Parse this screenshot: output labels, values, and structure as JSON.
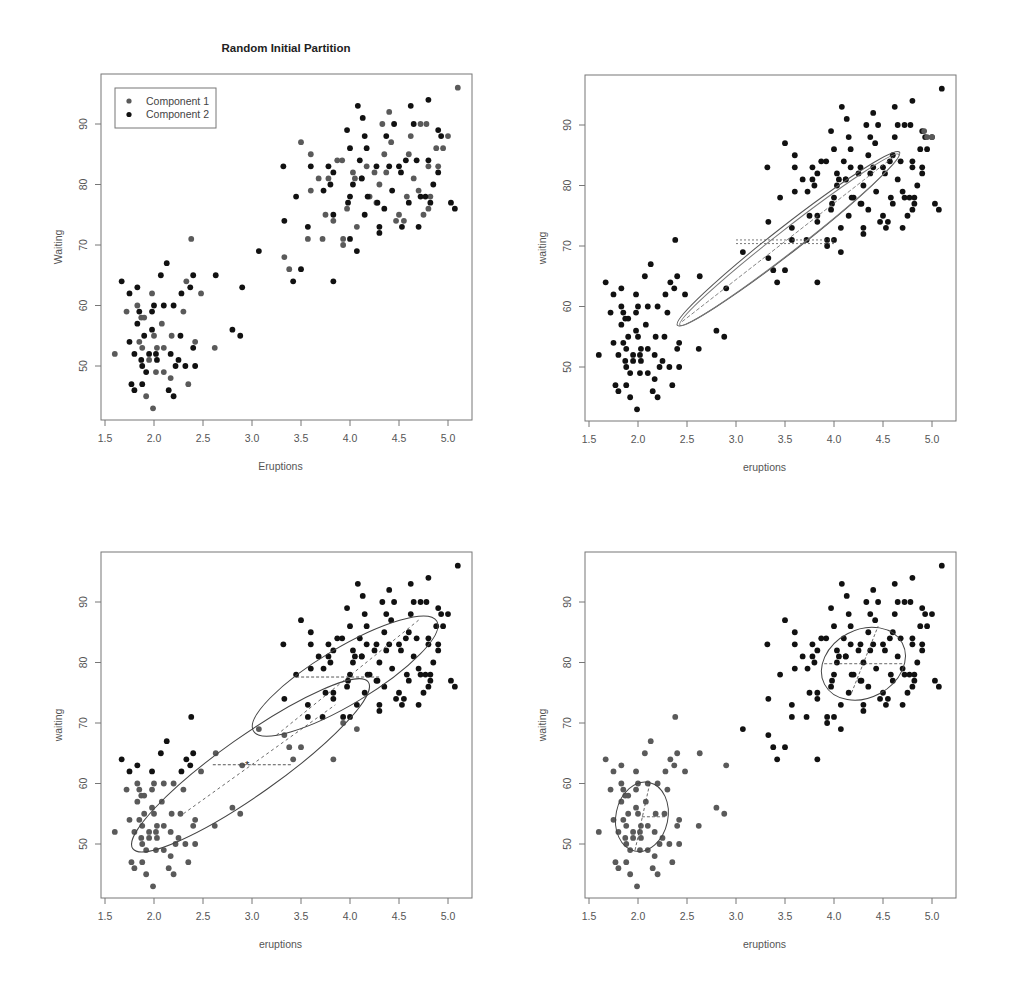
{
  "figure": {
    "title": "Random Initial Partition",
    "colors": {
      "component1": "#5a5a5a",
      "component2": "#111111",
      "axis": "#777777",
      "text": "#555555",
      "ellipse": "#444444"
    }
  },
  "chart_data": [
    {
      "type": "scatter",
      "panel": "top-left",
      "title": "Random Initial Partition",
      "xlabel": "Eruptions",
      "ylabel": "Waiting",
      "xticks": [
        "1.5",
        "2.0",
        "2.5",
        "3.0",
        "3.5",
        "4.0",
        "4.5",
        "5.0"
      ],
      "yticks": [
        "50",
        "60",
        "70",
        "80",
        "90"
      ],
      "xlim": [
        1.55,
        5.2
      ],
      "ylim": [
        41.5,
        97
      ],
      "legend": {
        "position": "top-left",
        "entries": [
          "Component 1",
          "Component 2"
        ]
      },
      "series": [
        {
          "name": "Component 1",
          "color": "#5a5a5a",
          "points": [
            [
              1.6,
              52
            ],
            [
              1.72,
              59
            ],
            [
              1.83,
              60
            ],
            [
              1.85,
              54
            ],
            [
              1.87,
              58
            ],
            [
              1.88,
              53
            ],
            [
              1.9,
              58
            ],
            [
              1.92,
              45
            ],
            [
              1.95,
              51
            ],
            [
              1.98,
              62
            ],
            [
              1.99,
              43
            ],
            [
              2.0,
              55
            ],
            [
              2.02,
              49
            ],
            [
              2.03,
              53
            ],
            [
              2.08,
              57
            ],
            [
              2.1,
              53
            ],
            [
              2.1,
              49
            ],
            [
              2.17,
              48
            ],
            [
              2.18,
              55
            ],
            [
              2.3,
              59
            ],
            [
              2.33,
              64
            ],
            [
              2.35,
              47
            ],
            [
              2.38,
              71
            ],
            [
              2.42,
              54
            ],
            [
              2.48,
              62
            ],
            [
              2.62,
              53
            ],
            [
              3.33,
              68
            ],
            [
              3.38,
              66
            ],
            [
              3.5,
              87
            ],
            [
              3.6,
              85
            ],
            [
              3.6,
              79
            ],
            [
              3.57,
              71
            ],
            [
              3.68,
              81
            ],
            [
              3.72,
              71
            ],
            [
              3.75,
              75
            ],
            [
              3.78,
              81
            ],
            [
              3.83,
              74
            ],
            [
              3.87,
              84
            ],
            [
              3.92,
              84
            ],
            [
              3.93,
              70
            ],
            [
              3.93,
              71
            ],
            [
              3.97,
              76
            ],
            [
              4.03,
              82
            ],
            [
              4.05,
              81
            ],
            [
              4.07,
              73
            ],
            [
              4.12,
              81
            ],
            [
              4.17,
              83
            ],
            [
              4.2,
              78
            ],
            [
              4.25,
              82
            ],
            [
              4.27,
              77
            ],
            [
              4.3,
              80
            ],
            [
              4.33,
              90
            ],
            [
              4.35,
              85
            ],
            [
              4.37,
              82
            ],
            [
              4.4,
              92
            ],
            [
              4.42,
              87
            ],
            [
              4.47,
              74
            ],
            [
              4.5,
              75
            ],
            [
              4.55,
              74
            ],
            [
              4.58,
              78
            ],
            [
              4.6,
              85
            ],
            [
              4.62,
              88
            ],
            [
              4.65,
              81
            ],
            [
              4.7,
              79
            ],
            [
              4.72,
              90
            ],
            [
              4.75,
              75
            ],
            [
              4.78,
              90
            ],
            [
              4.8,
              83
            ],
            [
              4.8,
              76
            ],
            [
              4.82,
              78
            ],
            [
              4.88,
              86
            ],
            [
              4.9,
              83
            ],
            [
              4.95,
              86
            ],
            [
              5.0,
              88
            ],
            [
              5.1,
              96
            ]
          ]
        },
        {
          "name": "Component 2",
          "color": "#111111",
          "points": [
            [
              1.67,
              64
            ],
            [
              1.75,
              62
            ],
            [
              1.75,
              54
            ],
            [
              1.77,
              47
            ],
            [
              1.8,
              52
            ],
            [
              1.8,
              46
            ],
            [
              1.83,
              63
            ],
            [
              1.83,
              57
            ],
            [
              1.85,
              59
            ],
            [
              1.87,
              51
            ],
            [
              1.88,
              50
            ],
            [
              1.88,
              47
            ],
            [
              1.9,
              55
            ],
            [
              1.92,
              49
            ],
            [
              1.95,
              52
            ],
            [
              1.98,
              56
            ],
            [
              1.98,
              59
            ],
            [
              2.0,
              60
            ],
            [
              2.02,
              52
            ],
            [
              2.03,
              51
            ],
            [
              2.07,
              65
            ],
            [
              2.1,
              60
            ],
            [
              2.13,
              67
            ],
            [
              2.15,
              46
            ],
            [
              2.17,
              52
            ],
            [
              2.2,
              60
            ],
            [
              2.2,
              45
            ],
            [
              2.22,
              50
            ],
            [
              2.25,
              51
            ],
            [
              2.27,
              55
            ],
            [
              2.28,
              62
            ],
            [
              2.32,
              50
            ],
            [
              2.37,
              63
            ],
            [
              2.4,
              65
            ],
            [
              2.42,
              50
            ],
            [
              2.4,
              53
            ],
            [
              2.63,
              65
            ],
            [
              2.8,
              56
            ],
            [
              2.88,
              55
            ],
            [
              2.9,
              63
            ],
            [
              3.07,
              69
            ],
            [
              3.32,
              83
            ],
            [
              3.33,
              74
            ],
            [
              3.42,
              64
            ],
            [
              3.45,
              78
            ],
            [
              3.5,
              66
            ],
            [
              3.57,
              73
            ],
            [
              3.6,
              83
            ],
            [
              3.73,
              79
            ],
            [
              3.78,
              83
            ],
            [
              3.8,
              80
            ],
            [
              3.83,
              82
            ],
            [
              3.83,
              75
            ],
            [
              3.83,
              64
            ],
            [
              3.97,
              89
            ],
            [
              3.98,
              77
            ],
            [
              4.0,
              86
            ],
            [
              4.0,
              78
            ],
            [
              4.0,
              71
            ],
            [
              4.03,
              80
            ],
            [
              4.07,
              69
            ],
            [
              4.08,
              93
            ],
            [
              4.1,
              84
            ],
            [
              4.12,
              81
            ],
            [
              4.13,
              91
            ],
            [
              4.15,
              88
            ],
            [
              4.15,
              75
            ],
            [
              4.17,
              86
            ],
            [
              4.18,
              78
            ],
            [
              4.27,
              83
            ],
            [
              4.28,
              77
            ],
            [
              4.3,
              73
            ],
            [
              4.3,
              72
            ],
            [
              4.35,
              76
            ],
            [
              4.37,
              88
            ],
            [
              4.4,
              83
            ],
            [
              4.43,
              79
            ],
            [
              4.45,
              90
            ],
            [
              4.5,
              83
            ],
            [
              4.52,
              82
            ],
            [
              4.53,
              73
            ],
            [
              4.57,
              84
            ],
            [
              4.6,
              77
            ],
            [
              4.62,
              93
            ],
            [
              4.65,
              90
            ],
            [
              4.68,
              84
            ],
            [
              4.7,
              73
            ],
            [
              4.72,
              78
            ],
            [
              4.77,
              78
            ],
            [
              4.8,
              94
            ],
            [
              4.8,
              84
            ],
            [
              4.82,
              77
            ],
            [
              4.85,
              80
            ],
            [
              4.9,
              89
            ],
            [
              4.9,
              82
            ],
            [
              4.93,
              88
            ],
            [
              5.03,
              77
            ],
            [
              5.07,
              76
            ]
          ]
        }
      ]
    },
    {
      "type": "scatter",
      "panel": "top-right",
      "xlabel": "eruptions",
      "ylabel": "waiting",
      "xticks": [
        "1.5",
        "2.0",
        "2.5",
        "3.0",
        "3.5",
        "4.0",
        "4.5",
        "5.0"
      ],
      "yticks": [
        "50",
        "60",
        "70",
        "80",
        "90"
      ],
      "xlim": [
        1.55,
        5.2
      ],
      "ylim": [
        41.5,
        97
      ],
      "ellipses": [
        {
          "cx": 3.55,
          "cy": 71,
          "major_end1": [
            2.45,
            57.5
          ],
          "major_end2": [
            4.6,
            84.8
          ],
          "halfwidth_px": 9,
          "style": "solid double"
        }
      ],
      "series": [
        {
          "name": "Component 1",
          "color": "#5a5a5a",
          "points": [
            [
              4.92,
              89
            ],
            [
              4.95,
              88
            ],
            [
              5.0,
              88
            ]
          ]
        },
        {
          "name": "Component 2",
          "color": "#111111",
          "points": "all remaining observations"
        }
      ]
    },
    {
      "type": "scatter",
      "panel": "bottom-left",
      "xlabel": "eruptions",
      "ylabel": "waiting",
      "xticks": [
        "1.5",
        "2.0",
        "2.5",
        "3.0",
        "3.5",
        "4.0",
        "4.5",
        "5.0"
      ],
      "yticks": [
        "50",
        "60",
        "70",
        "80",
        "90"
      ],
      "xlim": [
        1.55,
        5.2
      ],
      "ylim": [
        41.5,
        97
      ],
      "ellipses": [
        {
          "center": [
            2.95,
            63
          ],
          "major_end1": [
            1.85,
            50
          ],
          "major_end2": [
            4.1,
            76
          ],
          "minor_halfwidth_x": 0.55
        },
        {
          "center": [
            4.0,
            77.5
          ],
          "major_end1": [
            3.05,
            69
          ],
          "major_end2": [
            4.85,
            87
          ],
          "minor_halfwidth_x": 0.6
        }
      ]
    },
    {
      "type": "scatter",
      "panel": "bottom-right",
      "xlabel": "eruptions",
      "ylabel": "waiting",
      "xticks": [
        "1.5",
        "2.0",
        "2.5",
        "3.0",
        "3.5",
        "4.0",
        "4.5",
        "5.0"
      ],
      "yticks": [
        "50",
        "60",
        "70",
        "80",
        "90"
      ],
      "xlim": [
        1.55,
        5.2
      ],
      "ylim": [
        41.5,
        97
      ],
      "ellipses": [
        {
          "center": [
            2.04,
            54.5
          ],
          "rx_units": 0.3,
          "ry_units": 5.8,
          "tilt": "slight"
        },
        {
          "center": [
            4.3,
            80
          ],
          "rx_units": 0.45,
          "ry_units": 6.3,
          "tilt": "positive"
        }
      ],
      "clusters": {
        "component1": "points with eruptions < 3.0 (gray)",
        "component2": "points with eruptions >= 3.0 (black)"
      }
    }
  ],
  "panels": [
    {
      "id": "tl",
      "xlabel": "Eruptions",
      "ylabel": "Waiting"
    },
    {
      "id": "tr",
      "xlabel": "eruptions",
      "ylabel": "waiting"
    },
    {
      "id": "bl",
      "xlabel": "eruptions",
      "ylabel": "waiting"
    },
    {
      "id": "br",
      "xlabel": "eruptions",
      "ylabel": "waiting"
    }
  ],
  "legend": {
    "entries": [
      {
        "label": "Component 1",
        "color": "#5a5a5a"
      },
      {
        "label": "Component 2",
        "color": "#111111"
      }
    ]
  },
  "xticks": [
    "1.5",
    "2.0",
    "2.5",
    "3.0",
    "3.5",
    "4.0",
    "4.5",
    "5.0"
  ],
  "yticks": [
    "50",
    "60",
    "70",
    "80",
    "90"
  ]
}
